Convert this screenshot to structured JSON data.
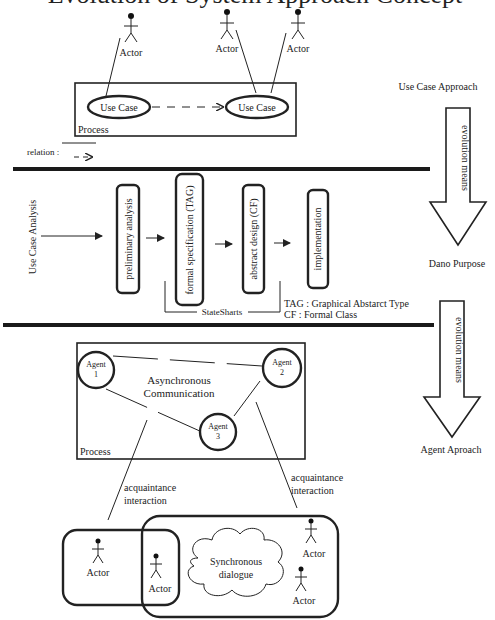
{
  "title": {
    "text": "Evolution of System Approach Concept"
  },
  "section1": {
    "actors": [
      {
        "label": "Actor",
        "x": 130,
        "y": 15
      },
      {
        "label": "Actor",
        "x": 227,
        "y": 12
      },
      {
        "label": "Actor",
        "x": 297,
        "y": 12
      }
    ],
    "process_label": "Process",
    "use_cases": [
      {
        "label": "Use Case"
      },
      {
        "label": "Use Case"
      }
    ],
    "relation_legend": {
      "label": "relation :"
    },
    "side_label": "Use Case Approach"
  },
  "evolution_arrows": [
    {
      "label": "evolution means"
    },
    {
      "label": "evolution means"
    }
  ],
  "section2": {
    "input_label": "Use Case Analysis",
    "stages": [
      {
        "label": "preliminary analysis"
      },
      {
        "label": "formal specification (TAG)"
      },
      {
        "label": "abstract design (CF)"
      },
      {
        "label": "implementation"
      }
    ],
    "bracket_label": "StateSharts",
    "legend": [
      "TAG : Graphical Abstarct Type",
      "CF : Formal Class"
    ],
    "side_label": "Dano Purpose"
  },
  "section3": {
    "agents": [
      {
        "line1": "Agent",
        "line2": "1"
      },
      {
        "line1": "Agent",
        "line2": "2"
      },
      {
        "line1": "Agent",
        "line2": "3"
      }
    ],
    "async_label": [
      "Asynchronous",
      "Communication"
    ],
    "process_label": "Process",
    "acquaintance_left": [
      "acquaintance",
      "interaction"
    ],
    "acquaintance_right": [
      "acquaintance",
      "interaction"
    ],
    "cloud_label": [
      "Synchronous",
      "dialogue"
    ],
    "actors": [
      {
        "label": "Actor"
      },
      {
        "label": "Actor"
      },
      {
        "label": "Actor"
      },
      {
        "label": "Actor"
      }
    ],
    "side_label": "Agent Aproach"
  }
}
